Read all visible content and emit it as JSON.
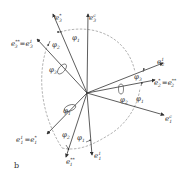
{
  "diagram": {
    "panel_label": "b",
    "center": [
      87,
      93
    ],
    "vectors": [
      {
        "id": "e3c",
        "base": "e",
        "sub": "3",
        "sup": "c",
        "end": [
          88,
          14
        ],
        "label_pos": [
          89,
          18
        ]
      },
      {
        "id": "e3star",
        "base": "e",
        "sub": "3",
        "sup": "*",
        "end": [
          53,
          14
        ],
        "label_pos": [
          55,
          18
        ]
      },
      {
        "id": "e3starstar_eq_e3_1",
        "base": "e",
        "sub": "3",
        "sup": "**",
        "label": "e3** = e3¹",
        "end": [
          37,
          39
        ],
        "label_pos": [
          12,
          44
        ]
      },
      {
        "id": "e2_1",
        "base": "e",
        "sub": "2",
        "sup": "1",
        "end": [
          163,
          63
        ],
        "label_pos": [
          157,
          62
        ]
      },
      {
        "id": "e2star_eq_e2starstar",
        "base": "e",
        "sub": "2",
        "sup": "*",
        "label": "e2* = e2**",
        "end": [
          155,
          80
        ],
        "label_pos": [
          153,
          84
        ]
      },
      {
        "id": "e1c",
        "base": "e",
        "sub": "1",
        "sup": "c",
        "end": [
          164,
          115
        ],
        "label_pos": [
          165,
          121
        ]
      },
      {
        "id": "e1_1_eq_e1star",
        "base": "e",
        "sub": "1",
        "sup": "1",
        "label": "e1¹ = e1*",
        "end": [
          47,
          134
        ],
        "label_pos": [
          17,
          140
        ]
      },
      {
        "id": "e1starstar",
        "base": "e",
        "sub": "1",
        "sup": "**",
        "end": [
          66,
          157
        ],
        "label_pos": [
          67,
          163
        ]
      },
      {
        "id": "e1_1",
        "base": "e",
        "sub": "1",
        "sup": "1",
        "end": [
          92,
          155
        ],
        "label_pos": [
          94,
          157
        ]
      }
    ],
    "angles": [
      {
        "label": "φ",
        "sub": "1",
        "pos": [
          72,
          39
        ]
      },
      {
        "label": "φ",
        "sub": "2",
        "pos": [
          53,
          46
        ]
      },
      {
        "label": "φ",
        "sub": "3",
        "pos": [
          50,
          71
        ]
      },
      {
        "label": "φ",
        "sub": "3",
        "pos": [
          134,
          77
        ]
      },
      {
        "label": "φ",
        "sub": "1",
        "pos": [
          136,
          100
        ]
      },
      {
        "label": "φ",
        "sub": "2",
        "pos": [
          121,
          101
        ]
      },
      {
        "label": "φ",
        "sub": "1",
        "pos": [
          64,
          113
        ]
      },
      {
        "label": "φ",
        "sub": "2",
        "pos": [
          64,
          135
        ]
      },
      {
        "label": "φ",
        "sub": "1",
        "pos": [
          78,
          139
        ]
      }
    ]
  }
}
